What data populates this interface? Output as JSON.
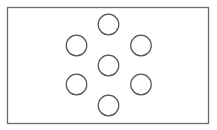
{
  "diagram": {
    "canvas": {
      "width": 217,
      "height": 130,
      "background": "#ffffff"
    },
    "frame": {
      "x": 7,
      "y": 7,
      "width": 201,
      "height": 116,
      "stroke": "#6b6b6b",
      "stroke_width": 1.3
    },
    "circle_style": {
      "r": 10.3,
      "stroke": "#555555",
      "stroke_width": 1.2,
      "fill": "none"
    },
    "circles": [
      {
        "id": "top",
        "cx": 108.5,
        "cy": 24.5
      },
      {
        "id": "upper-left",
        "cx": 76.5,
        "cy": 45.5
      },
      {
        "id": "upper-right",
        "cx": 141,
        "cy": 45.5
      },
      {
        "id": "center",
        "cx": 108.5,
        "cy": 65.5
      },
      {
        "id": "lower-left",
        "cx": 76.5,
        "cy": 84.5
      },
      {
        "id": "lower-right",
        "cx": 141,
        "cy": 84.5
      },
      {
        "id": "bottom",
        "cx": 108.5,
        "cy": 105.5
      }
    ]
  }
}
